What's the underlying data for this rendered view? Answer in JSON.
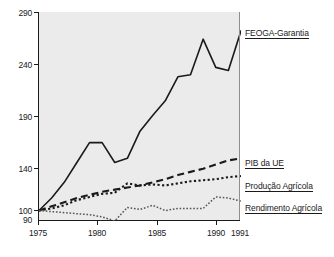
{
  "chart_data": {
    "type": "line",
    "title": "",
    "subtitle": "",
    "xlabel": "",
    "ylabel": "",
    "x": [
      1975,
      1976,
      1977,
      1978,
      1979,
      1980,
      1981,
      1982,
      1983,
      1984,
      1985,
      1986,
      1987,
      1988,
      1989,
      1990,
      1991
    ],
    "xlim": [
      1975,
      1991
    ],
    "ylim": [
      90,
      290
    ],
    "yticks": [
      90,
      100,
      140,
      190,
      240,
      290
    ],
    "xticks": [
      1975,
      1980,
      1985,
      1990,
      1991
    ],
    "xtick_labels": [
      "1975",
      "1980",
      "1985",
      "1990",
      "1991"
    ],
    "ytick_labels": [
      "290",
      "240",
      "190",
      "140",
      "100",
      "90"
    ],
    "grid": false,
    "legend_position": "inline-right",
    "note_index_base": "1975 = 100",
    "series": [
      {
        "name": "FEOGA-Garantia",
        "style": "solid",
        "color": "#1a1a1a",
        "label_value_1991": 272,
        "values": [
          100,
          112,
          127,
          146,
          165,
          165,
          146,
          150,
          176,
          191,
          205,
          228,
          230,
          264,
          237,
          234,
          272
        ]
      },
      {
        "name": "PIB da UE",
        "style": "dashed",
        "color": "#1a1a1a",
        "label_value_1991": 150,
        "values": [
          100,
          104,
          108,
          112,
          115,
          118,
          120,
          122,
          124,
          127,
          130,
          134,
          137,
          140,
          144,
          148,
          150
        ]
      },
      {
        "name": "Produção Agrícola",
        "style": "dotted",
        "color": "#1a1a1a",
        "label_value_1991": 133,
        "values": [
          100,
          102,
          105,
          110,
          113,
          116,
          117,
          126,
          124,
          125,
          124,
          126,
          128,
          129,
          130,
          132,
          133
        ]
      },
      {
        "name": "Rendimento Agrícola",
        "style": "dotted-thin",
        "color": "#6e6e6e",
        "label_value_1991": 109,
        "values": [
          100,
          99,
          98,
          97,
          96,
          94,
          90,
          103,
          101,
          105,
          100,
          102,
          102,
          102,
          113,
          112,
          109
        ]
      }
    ]
  },
  "labels": {
    "feoga": "FEOGA-Garantia",
    "pib": "PIB da UE",
    "producao": "Produção Agrícola",
    "rendimento": "Rendimento Agrícola"
  },
  "yticks": {
    "t290": "290",
    "t240": "240",
    "t190": "190",
    "t140": "140",
    "t100": "100",
    "t90": "90"
  },
  "xticks": {
    "t1975": "1975",
    "t1980": "1980",
    "t1985": "1985",
    "t1990": "1990",
    "t1991": "1991"
  }
}
